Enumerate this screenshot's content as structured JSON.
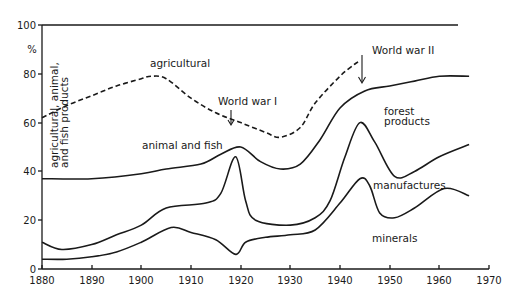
{
  "chart_data": {
    "type": "line",
    "title": "",
    "xlabel": "",
    "ylabel": "%",
    "xlim": [
      1880,
      1970
    ],
    "ylim": [
      0,
      100
    ],
    "grid": false,
    "legend": "inline labels",
    "x_ticks": [
      1880,
      1890,
      1900,
      1910,
      1920,
      1930,
      1940,
      1950,
      1960,
      1970
    ],
    "y_ticks": [
      0,
      20,
      40,
      60,
      80,
      100
    ],
    "y_tick_labels": [
      "0",
      "20",
      "40",
      "60",
      "80",
      "100"
    ],
    "vertical_label": [
      "agricultural, animal,",
      "and  fish  products"
    ],
    "series": [
      {
        "name": "agricultural",
        "style": "dashed",
        "x": [
          1880,
          1885,
          1890,
          1895,
          1900,
          1902,
          1905,
          1910,
          1915,
          1920,
          1925,
          1928,
          1932,
          1935,
          1940,
          1943,
          1944
        ],
        "values": [
          62,
          67,
          71,
          75,
          78,
          79,
          78,
          70,
          64,
          60,
          56,
          54,
          58,
          68,
          79,
          84,
          85
        ]
      },
      {
        "name": "animal and fish",
        "style": "solid",
        "x": [
          1880,
          1890,
          1900,
          1905,
          1912,
          1916,
          1920,
          1924,
          1928,
          1932,
          1936,
          1940,
          1945,
          1950,
          1955,
          1960,
          1966
        ],
        "values": [
          37,
          37,
          39,
          41,
          43,
          47,
          50,
          44,
          41,
          43,
          53,
          66,
          73,
          75,
          77,
          79,
          79
        ]
      },
      {
        "name": "forest products",
        "style": "solid",
        "x": [
          1880,
          1884,
          1890,
          1895,
          1900,
          1905,
          1913,
          1916,
          1919,
          1921,
          1923,
          1930,
          1935,
          1938,
          1941,
          1944,
          1947,
          1951,
          1955,
          1960,
          1966
        ],
        "values": [
          11,
          8,
          10,
          14,
          18,
          25,
          27,
          31,
          46,
          28,
          20,
          18,
          21,
          28,
          46,
          60,
          52,
          38,
          40,
          46,
          51
        ]
      },
      {
        "name": "manufactures",
        "style": "solid",
        "x": [
          1880,
          1885,
          1890,
          1895,
          1900,
          1906,
          1910,
          1915,
          1919,
          1921,
          1925,
          1930,
          1935,
          1940,
          1944,
          1946,
          1948,
          1951,
          1955,
          1961,
          1966
        ],
        "values": [
          4,
          4,
          5,
          7,
          11,
          17,
          15,
          12,
          6,
          11,
          13,
          14,
          16,
          27,
          37,
          34,
          23,
          21,
          25,
          33,
          30
        ]
      }
    ],
    "annotations": [
      {
        "text": "agricultural",
        "x": 1902,
        "y": 84
      },
      {
        "text": "World war I",
        "x": 1917,
        "y": 71,
        "arrow_to": [
          1918,
          63
        ]
      },
      {
        "text": "World war II",
        "x": 1946,
        "y": 93,
        "arrow_to": [
          1945,
          75
        ]
      },
      {
        "text": "animal and fish",
        "x": 1903,
        "y": 53
      },
      {
        "text": "forest products",
        "x": 1947,
        "y": 63
      },
      {
        "text": "manufactures",
        "x": 1950,
        "y": 27
      },
      {
        "text": "minerals",
        "x": 1949,
        "y": 12
      }
    ]
  },
  "axis": {
    "percent_symbol": "%",
    "y_labels": [
      "100",
      "80",
      "60",
      "40",
      "20",
      "0"
    ],
    "x_labels": [
      "1880",
      "1890",
      "1900",
      "1910",
      "1920",
      "1930",
      "1940",
      "1950",
      "1960",
      "1970"
    ]
  },
  "labels": {
    "agricultural": "agricultural",
    "ww1": "World war I",
    "ww2": "World war II",
    "animal_fish": "animal and fish",
    "forest_1": "forest",
    "forest_2": "products",
    "manufactures": "manufactures",
    "minerals": "minerals",
    "vertical_1": "agricultural, animal,",
    "vertical_2": "and  fish  products"
  }
}
